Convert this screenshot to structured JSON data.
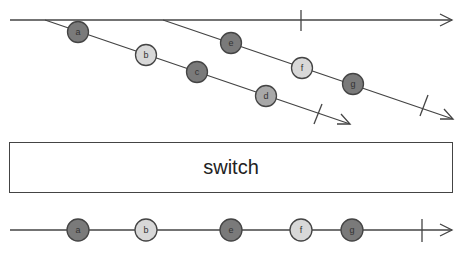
{
  "operator": {
    "label": "switch"
  },
  "colors": {
    "dark": "#7a7a7a",
    "light": "#d8d8d8",
    "stroke": "#444444"
  },
  "outer_stream": {
    "complete": true
  },
  "inner_streams": [
    {
      "marbles": [
        "a",
        "b",
        "c",
        "d"
      ],
      "complete": true
    },
    {
      "marbles": [
        "e",
        "f",
        "g"
      ],
      "complete": true
    }
  ],
  "output_stream": {
    "marbles": [
      "a",
      "b",
      "e",
      "f",
      "g"
    ],
    "complete": true
  },
  "marbles": {
    "a": "a",
    "b": "b",
    "c": "c",
    "d": "d",
    "e": "e",
    "f": "f",
    "g": "g"
  }
}
